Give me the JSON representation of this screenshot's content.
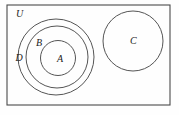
{
  "figure": {
    "background_color": "#fefefe",
    "stroke_color": "#555555",
    "label_color": "#1a1a1a",
    "width": 179,
    "height": 115
  },
  "universe": {
    "label": "U",
    "label_x": 16,
    "label_y": 17,
    "rect": {
      "x": 7,
      "y": 5,
      "width": 163,
      "height": 100
    },
    "stroke_color": "#4a4a4a"
  },
  "sets": [
    {
      "id": "D",
      "label": "D",
      "cx": 56,
      "cy": 57,
      "r": 38,
      "label_x": 15.5,
      "label_y": 61,
      "stroke_color": "#555555"
    },
    {
      "id": "B",
      "label": "B",
      "cx": 57,
      "cy": 57,
      "r": 31,
      "label_x": 36,
      "label_y": 46,
      "stroke_color": "#555555"
    },
    {
      "id": "A",
      "label": "A",
      "cx": 58,
      "cy": 58,
      "r": 17.5,
      "label_x": 57,
      "label_y": 62,
      "stroke_color": "#555555"
    },
    {
      "id": "C",
      "label": "C",
      "cx": 133,
      "cy": 41,
      "r": 30,
      "label_x": 130,
      "label_y": 44,
      "stroke_color": "#555555"
    }
  ],
  "label_font_size": 10
}
